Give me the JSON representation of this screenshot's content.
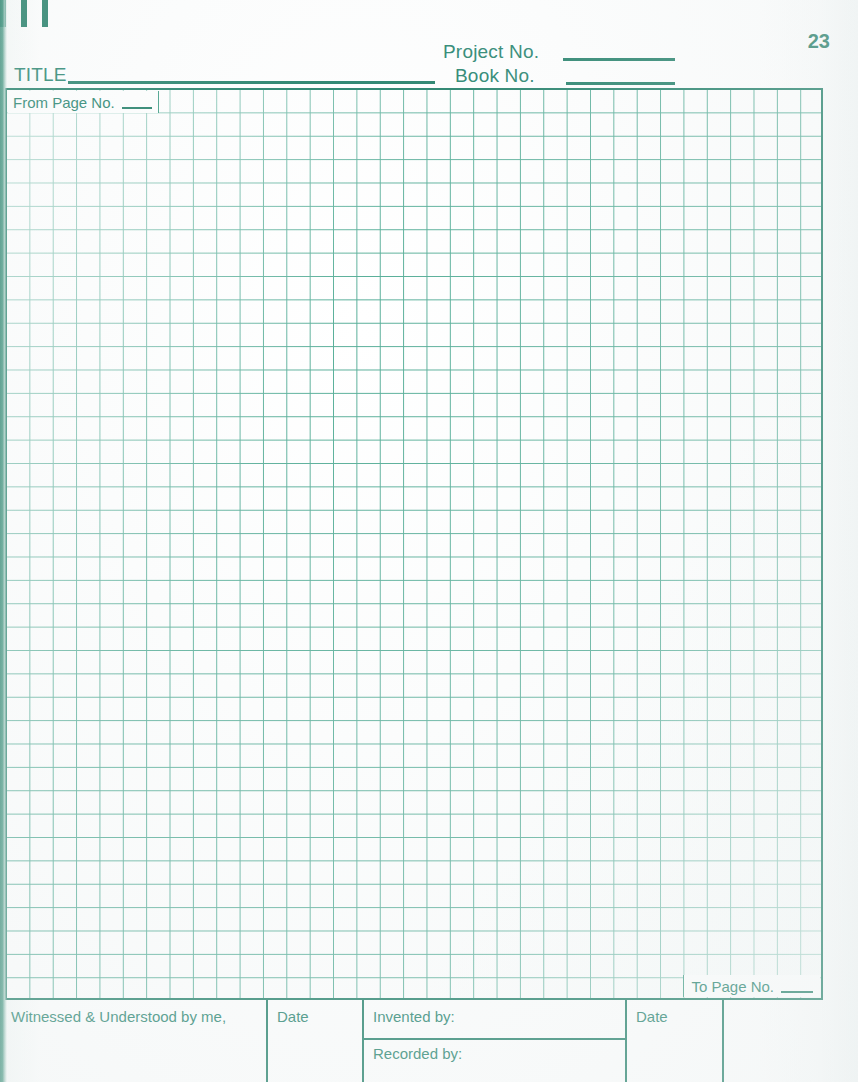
{
  "document": {
    "kind": "laboratory-notebook-page",
    "page_number": "23",
    "ink_color": "#1e7d66",
    "grid_line_color": "#55ad97",
    "paper_color": "#ffffff"
  },
  "top_marks": {
    "count": 3,
    "name": "binding-tick-marks"
  },
  "header": {
    "title_label": "TITLE",
    "project_label": "Project No.",
    "book_label": "Book No.",
    "title_value": "",
    "project_value": "",
    "book_value": "",
    "title_placeholder": "",
    "project_placeholder": "",
    "book_placeholder": ""
  },
  "grid": {
    "from_page_label": "From Page No.",
    "from_page_value": "",
    "to_page_label": "To Page No.",
    "to_page_value": "",
    "columns": 35,
    "rows": 39,
    "cell_size_px": "23.4"
  },
  "footer": {
    "witness_label": "Witnessed & Understood by me,",
    "witness_date_label": "Date",
    "invented_label": "Invented by:",
    "invented_date_label": "Date",
    "recorded_label": "Recorded by:",
    "witness_value": "",
    "witness_date_value": "",
    "invented_value": "",
    "invented_date_value": "",
    "recorded_value": ""
  }
}
